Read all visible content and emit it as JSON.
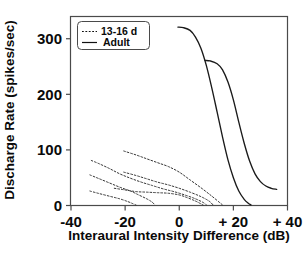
{
  "chart_data": {
    "type": "line",
    "title": "",
    "xlabel": "Interaural Intensity Difference (dB)",
    "ylabel": "Discharge Rate (spikes/sec)",
    "xlim": [
      -40,
      40
    ],
    "ylim": [
      0,
      340
    ],
    "grid": false,
    "legend_position": "top-left",
    "xticks": [
      -40,
      -20,
      0,
      20,
      40
    ],
    "xtick_labels": [
      "-40",
      "-20",
      "0",
      "+ 20",
      "+ 40"
    ],
    "yticks": [
      0,
      100,
      200,
      300
    ],
    "ytick_labels": [
      "0",
      "100",
      "200",
      "300"
    ],
    "legend": [
      {
        "label": "13-16 d",
        "style": "dotted"
      },
      {
        "label": "Adult",
        "style": "solid"
      }
    ],
    "series": [
      {
        "name": "Adult 1",
        "style": "solid",
        "points": [
          [
            -0.5,
            321
          ],
          [
            1.5,
            320
          ],
          [
            4,
            315
          ],
          [
            6,
            303
          ],
          [
            8,
            283
          ],
          [
            10,
            252
          ],
          [
            12,
            212
          ],
          [
            14,
            168
          ],
          [
            16,
            123
          ],
          [
            18,
            82
          ],
          [
            20,
            50
          ],
          [
            22,
            26
          ],
          [
            24,
            11
          ],
          [
            25.5,
            4
          ],
          [
            26.5,
            1
          ]
        ]
      },
      {
        "name": "Adult 2",
        "style": "solid",
        "points": [
          [
            9.5,
            261
          ],
          [
            11.5,
            260
          ],
          [
            14,
            255
          ],
          [
            16,
            244
          ],
          [
            18,
            222
          ],
          [
            20,
            190
          ],
          [
            22,
            150
          ],
          [
            24,
            112
          ],
          [
            26,
            80
          ],
          [
            28,
            57
          ],
          [
            30,
            43
          ],
          [
            32,
            35
          ],
          [
            34,
            31
          ],
          [
            36,
            29
          ]
        ]
      },
      {
        "name": "13-16 d A",
        "style": "dotted",
        "points": [
          [
            -20.5,
            98
          ],
          [
            -16,
            91
          ],
          [
            -12,
            84
          ],
          [
            -8,
            77
          ],
          [
            -4,
            70
          ],
          [
            0,
            60
          ],
          [
            4,
            46
          ],
          [
            8,
            32
          ],
          [
            12,
            17
          ],
          [
            15,
            5
          ],
          [
            16,
            1
          ]
        ]
      },
      {
        "name": "13-16 d B",
        "style": "dotted",
        "points": [
          [
            -32.5,
            81
          ],
          [
            -30,
            76
          ],
          [
            -26,
            67
          ],
          [
            -22,
            57
          ],
          [
            -18,
            49
          ],
          [
            -14,
            42
          ],
          [
            -10,
            36
          ],
          [
            -6,
            30
          ],
          [
            -2,
            25
          ],
          [
            2,
            19
          ],
          [
            6,
            12
          ],
          [
            9,
            5
          ],
          [
            10,
            1
          ]
        ]
      },
      {
        "name": "13-16 d C",
        "style": "dotted",
        "points": [
          [
            -20.5,
            60
          ],
          [
            -16,
            54
          ],
          [
            -12,
            48
          ],
          [
            -8,
            42
          ],
          [
            -4,
            37
          ],
          [
            0,
            31
          ],
          [
            4,
            24
          ],
          [
            8,
            16
          ],
          [
            11,
            8
          ],
          [
            12.5,
            1
          ]
        ]
      },
      {
        "name": "13-16 d D",
        "style": "dotted",
        "points": [
          [
            -33,
            55
          ],
          [
            -30,
            49
          ],
          [
            -26,
            41
          ],
          [
            -22,
            33
          ],
          [
            -18,
            26
          ],
          [
            -15,
            19
          ],
          [
            -12,
            12
          ],
          [
            -10,
            6
          ],
          [
            -9,
            1
          ]
        ]
      },
      {
        "name": "13-16 d E",
        "style": "dotted",
        "points": [
          [
            -24,
            31
          ],
          [
            -20,
            28
          ],
          [
            -16,
            25
          ],
          [
            -12,
            24
          ],
          [
            -8,
            23
          ],
          [
            -4,
            22
          ],
          [
            0,
            19
          ],
          [
            3,
            14
          ],
          [
            6,
            8
          ],
          [
            8,
            3
          ],
          [
            8.8,
            1
          ]
        ]
      },
      {
        "name": "13-16 d F",
        "style": "dotted",
        "points": [
          [
            -33,
            26
          ],
          [
            -30,
            22
          ],
          [
            -26,
            17
          ],
          [
            -22,
            12
          ],
          [
            -19,
            7
          ],
          [
            -17,
            3
          ],
          [
            -16,
            1
          ]
        ]
      }
    ]
  }
}
